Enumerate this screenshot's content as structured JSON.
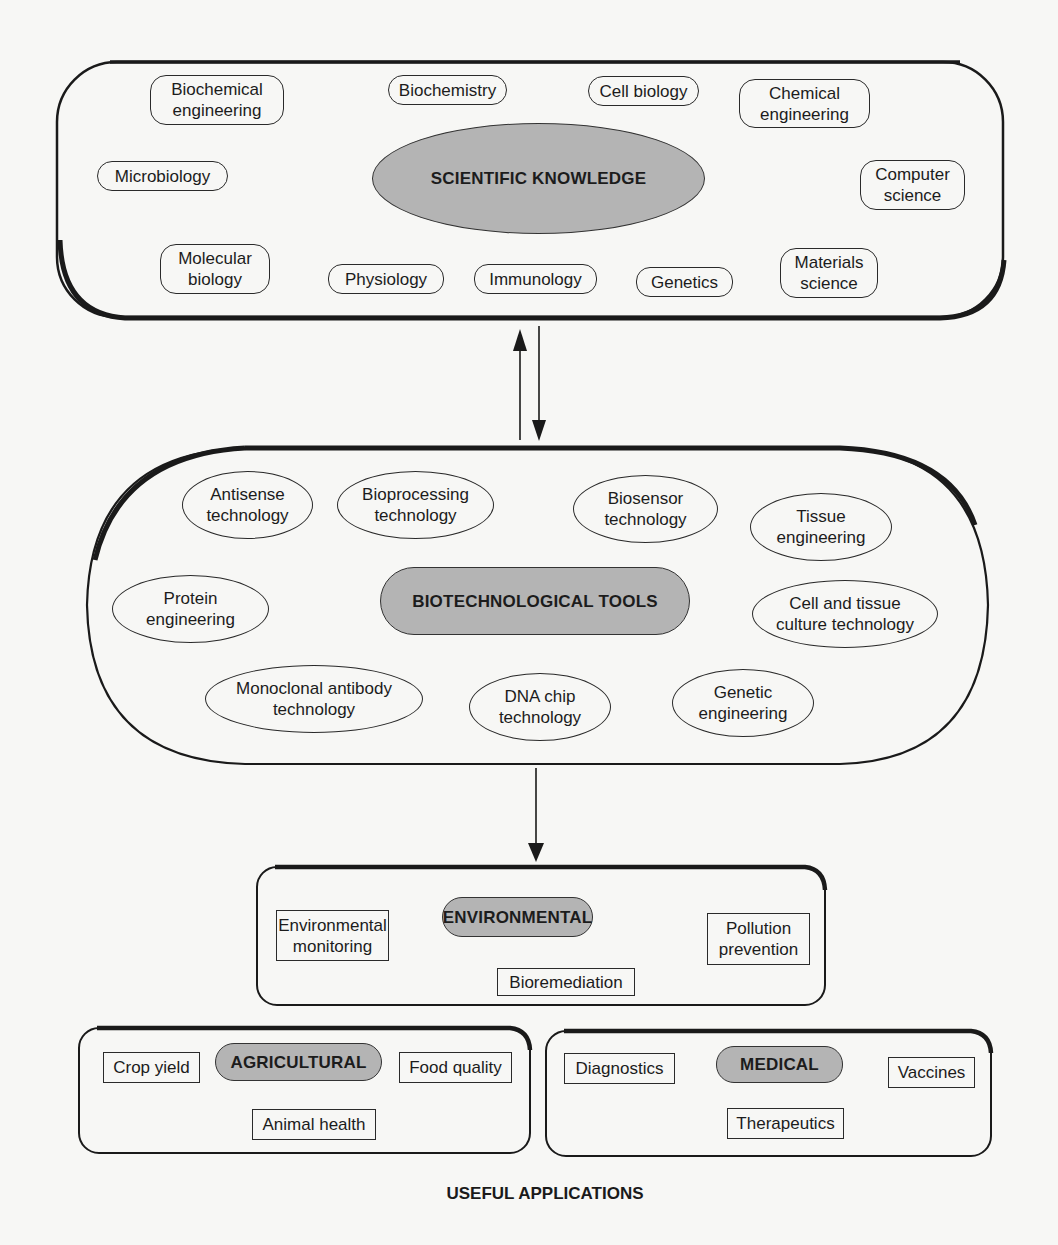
{
  "scientific_knowledge": {
    "title": "SCIENTIFIC KNOWLEDGE",
    "disciplines": [
      {
        "label": "Biochemical\nengineering"
      },
      {
        "label": "Biochemistry"
      },
      {
        "label": "Cell biology"
      },
      {
        "label": "Chemical\nengineering"
      },
      {
        "label": "Microbiology"
      },
      {
        "label": "Computer\nscience"
      },
      {
        "label": "Molecular\nbiology"
      },
      {
        "label": "Physiology"
      },
      {
        "label": "Immunology"
      },
      {
        "label": "Genetics"
      },
      {
        "label": "Materials\nscience"
      }
    ]
  },
  "biotechnological_tools": {
    "title": "BIOTECHNOLOGICAL TOOLS",
    "tools": [
      {
        "label": "Antisense\ntechnology"
      },
      {
        "label": "Bioprocessing\ntechnology"
      },
      {
        "label": "Biosensor\ntechnology"
      },
      {
        "label": "Tissue\nengineering"
      },
      {
        "label": "Protein\nengineering"
      },
      {
        "label": "Cell and tissue\nculture technology"
      },
      {
        "label": "Monoclonal antibody\ntechnology"
      },
      {
        "label": "DNA chip\ntechnology"
      },
      {
        "label": "Genetic\nengineering"
      }
    ]
  },
  "applications": {
    "caption": "USEFUL APPLICATIONS",
    "environmental": {
      "title": "ENVIRONMENTAL",
      "items": [
        {
          "label": "Environmental\nmonitoring"
        },
        {
          "label": "Pollution\nprevention"
        },
        {
          "label": "Bioremediation"
        }
      ]
    },
    "agricultural": {
      "title": "AGRICULTURAL",
      "items": [
        {
          "label": "Crop yield"
        },
        {
          "label": "Food quality"
        },
        {
          "label": "Animal health"
        }
      ]
    },
    "medical": {
      "title": "MEDICAL",
      "items": [
        {
          "label": "Diagnostics"
        },
        {
          "label": "Vaccines"
        },
        {
          "label": "Therapeutics"
        }
      ]
    }
  },
  "connections": [
    {
      "from": "scientific_knowledge",
      "to": "biotechnological_tools",
      "type": "bidirectional"
    },
    {
      "from": "biotechnological_tools",
      "to": "applications",
      "type": "one-way"
    }
  ],
  "colors": {
    "hub_fill": "#b4b4b4",
    "outline": "#1a1a1a",
    "background": "#f7f7f5"
  }
}
